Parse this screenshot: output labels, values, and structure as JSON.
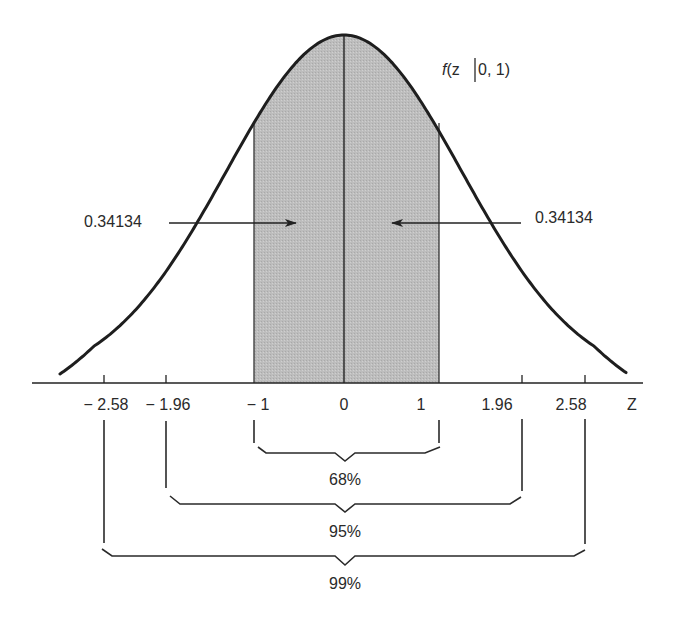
{
  "chart_data": {
    "type": "area",
    "title": "",
    "curve_label": "f(z|0, 1)",
    "xlabel": "Z",
    "ylabel": "",
    "distribution": "standard normal",
    "mean": 0,
    "std": 1,
    "x_ticks": [
      -2.58,
      -1.96,
      -1,
      0,
      1,
      1.96,
      2.58
    ],
    "x_tick_labels": [
      "− 2.58",
      "− 1.96",
      "− 1",
      "0",
      "1",
      "1.96",
      "2.58"
    ],
    "shaded_region": {
      "from": -1,
      "to": 1,
      "color": "#b9b9b9"
    },
    "annotations": [
      {
        "text": "0.34134",
        "target": "area between -1 and 0",
        "side": "left"
      },
      {
        "text": "0.34134",
        "target": "area between 0 and 1",
        "side": "right"
      }
    ],
    "intervals": [
      {
        "from": -1,
        "to": 1,
        "label": "68%"
      },
      {
        "from": -1.96,
        "to": 1.96,
        "label": "95%"
      },
      {
        "from": -2.58,
        "to": 2.58,
        "label": "99%"
      }
    ],
    "grid": false,
    "legend": "none"
  },
  "labels": {
    "curve": {
      "f": "f",
      "rest": "(z",
      "bar": "|",
      "params": "0, 1)"
    },
    "axis_name": "Z",
    "ticks": [
      "− 2.58",
      "− 1.96",
      "− 1",
      "0",
      "1",
      "1.96",
      "2.58"
    ],
    "area_left": "0.34134",
    "area_right": "0.34134",
    "interval_68": "68%",
    "interval_95": "95%",
    "interval_99": "99%"
  },
  "colors": {
    "ink": "#222222",
    "shade": "#b9b9b9",
    "background": "#ffffff"
  }
}
